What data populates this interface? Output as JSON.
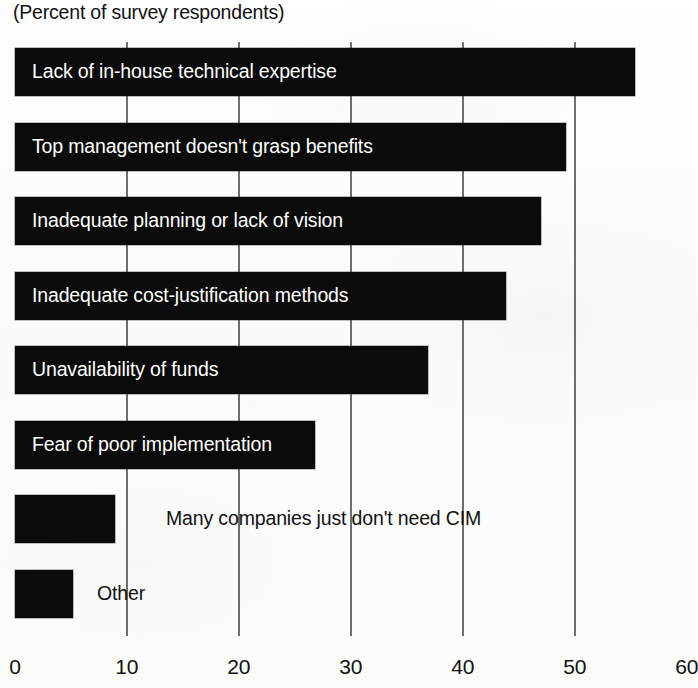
{
  "subtitle": "(Percent of survey respondents)",
  "chart_data": {
    "type": "bar",
    "orientation": "horizontal",
    "title": "",
    "subtitle": "(Percent of survey respondents)",
    "xlabel": "",
    "ylabel": "",
    "xlim": [
      0,
      60
    ],
    "xticks": [
      0,
      10,
      20,
      30,
      40,
      50,
      60
    ],
    "xtick_labels": [
      "0",
      "10",
      "20",
      "30",
      "40",
      "50",
      "60"
    ],
    "grid": true,
    "grid_axis": "x",
    "legend": false,
    "bar_color": "#0b0b0b",
    "categories": [
      "Lack of in-house technical expertise",
      "Top management doesn't grasp benefits",
      "Inadequate planning or lack of vision",
      "Inadequate cost-justification methods",
      "Unavailability of funds",
      "Fear of poor implementation",
      "Many companies just don't need CIM",
      "Other"
    ],
    "values": [
      55.4,
      49.2,
      47.0,
      43.8,
      36.9,
      26.8,
      8.9,
      5.2
    ],
    "label_placement": [
      "inside",
      "inside",
      "inside",
      "inside",
      "inside",
      "inside",
      "outside",
      "outside"
    ]
  }
}
